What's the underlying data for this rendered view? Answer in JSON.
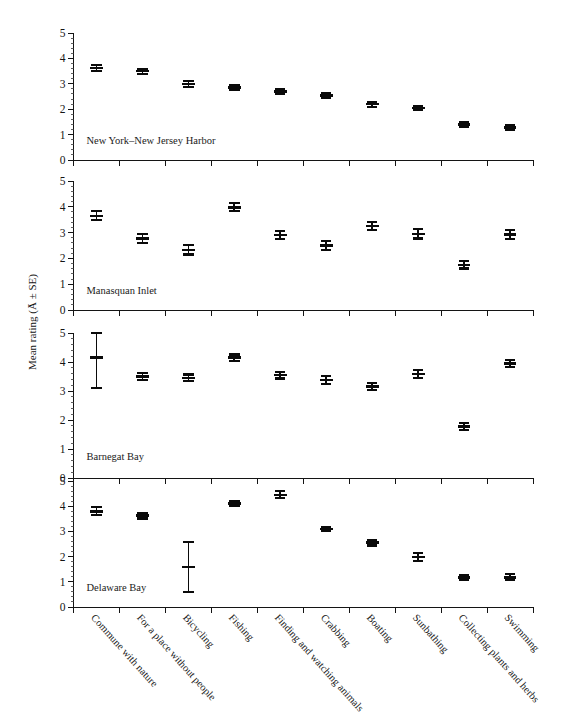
{
  "figure": {
    "ylabel": "Mean rating (Ā ± SE)",
    "y_tick_labels": [
      "0",
      "1",
      "2",
      "3",
      "4",
      "5"
    ],
    "y_ticks": [
      0,
      1,
      2,
      3,
      4,
      5
    ],
    "ylim": [
      0,
      5
    ],
    "categories": [
      "Commune with nature",
      "For a place without people",
      "Bicycling",
      "Fishing",
      "Finding and watching animals",
      "Crabbing",
      "Boating",
      "Sunbathing",
      "Collecting plants and herbs",
      "Swimming"
    ]
  },
  "chart_data": {
    "type": "scatter",
    "title": "",
    "xlabel": "",
    "ylabel": "Mean rating (Ā ± SE)",
    "ylim": [
      0,
      5
    ],
    "yticks": [
      0,
      1,
      2,
      3,
      4,
      5
    ],
    "grid": false,
    "legend": "none",
    "error_bars": "SE",
    "categories": [
      "Commune with nature",
      "For a place without people",
      "Bicycling",
      "Fishing",
      "Finding and watching animals",
      "Crabbing",
      "Boating",
      "Sunbathing",
      "Collecting plants and herbs",
      "Swimming"
    ],
    "panels": [
      {
        "label": "New York–New Jersey Harbor",
        "values": [
          3.62,
          3.5,
          3.0,
          2.85,
          2.7,
          2.55,
          2.2,
          2.05,
          1.4,
          1.28
        ],
        "errors": [
          0.13,
          0.1,
          0.12,
          0.1,
          0.09,
          0.1,
          0.1,
          0.09,
          0.08,
          0.08
        ]
      },
      {
        "label": "Manasquan Inlet",
        "values": [
          3.65,
          2.78,
          2.33,
          3.98,
          2.9,
          2.5,
          3.25,
          2.95,
          1.75,
          2.92
        ],
        "errors": [
          0.17,
          0.17,
          0.18,
          0.15,
          0.15,
          0.16,
          0.16,
          0.18,
          0.14,
          0.17
        ]
      },
      {
        "label": "Barnegat Bay",
        "values": [
          4.15,
          3.5,
          3.45,
          4.15,
          3.55,
          3.38,
          3.15,
          3.58,
          1.78,
          3.95
        ],
        "errors": [
          1.05,
          0.13,
          0.12,
          0.11,
          0.12,
          0.13,
          0.12,
          0.14,
          0.11,
          0.13
        ]
      },
      {
        "label": "Delaware Bay",
        "values": [
          3.8,
          3.62,
          1.58,
          4.1,
          4.45,
          3.1,
          2.55,
          1.98,
          1.18,
          1.18
        ],
        "errors": [
          0.16,
          0.11,
          1.0,
          0.09,
          0.14,
          0.09,
          0.11,
          0.16,
          0.1,
          0.12
        ]
      }
    ]
  }
}
